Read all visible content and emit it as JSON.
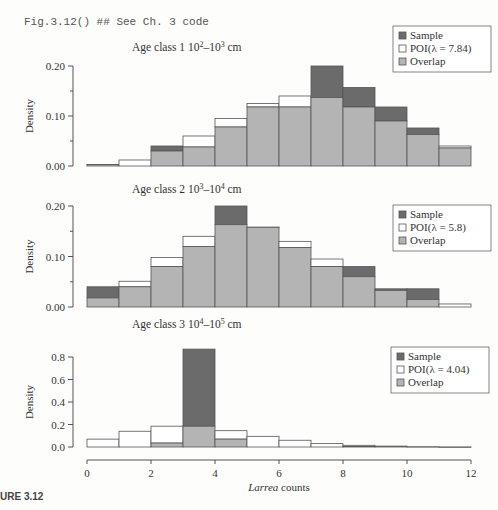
{
  "header": {
    "code_line": "Fig.3.12() ## See Ch. 3 code"
  },
  "caption": "URE 3.12",
  "colors": {
    "sample": "#6b6b6b",
    "poi": "#ffffff",
    "overlap": "#b4b4b4",
    "edge": "#555555"
  },
  "chart_data": [
    {
      "type": "bar",
      "title": "Age class 1  10²–10³ cm",
      "title_parts": {
        "prefix": "Age class 1  10",
        "sup1": "2",
        "mid": "–10",
        "sup2": "3",
        "suffix": " cm"
      },
      "ylabel": "Density",
      "ylim": [
        0,
        0.2
      ],
      "yticks": [
        "0.00",
        "0.10",
        "0.20"
      ],
      "bins": [
        0,
        1,
        2,
        3,
        4,
        5,
        6,
        7,
        8,
        9,
        10,
        11
      ],
      "series": [
        {
          "name": "Sample",
          "values": [
            0.003,
            0.0,
            0.04,
            0.038,
            0.078,
            0.118,
            0.118,
            0.2,
            0.157,
            0.118,
            0.076,
            0.036
          ]
        },
        {
          "name": "POI(λ = 7.84)",
          "values": [
            0.003,
            0.012,
            0.03,
            0.06,
            0.095,
            0.125,
            0.14,
            0.137,
            0.118,
            0.09,
            0.063,
            0.04
          ]
        }
      ],
      "legend": [
        "Sample",
        "POI(λ = 7.84)",
        "Overlap"
      ],
      "legend_position": "top-right"
    },
    {
      "type": "bar",
      "title": "Age class 2  10³–10⁴ cm",
      "title_parts": {
        "prefix": "Age class 2  10",
        "sup1": "3",
        "mid": "–10",
        "sup2": "4",
        "suffix": " cm"
      },
      "ylabel": "Density",
      "ylim": [
        0,
        0.2
      ],
      "yticks": [
        "0.00",
        "0.10",
        "0.20"
      ],
      "bins": [
        0,
        1,
        2,
        3,
        4,
        5,
        6,
        7,
        8,
        9,
        10,
        11
      ],
      "series": [
        {
          "name": "Sample",
          "values": [
            0.04,
            0.04,
            0.08,
            0.12,
            0.2,
            0.158,
            0.118,
            0.08,
            0.08,
            0.036,
            0.036,
            0.0
          ]
        },
        {
          "name": "POI(λ = 5.8)",
          "values": [
            0.018,
            0.051,
            0.098,
            0.14,
            0.163,
            0.158,
            0.13,
            0.095,
            0.06,
            0.033,
            0.015,
            0.006
          ]
        }
      ],
      "legend": [
        "Sample",
        "POI(λ = 5.8)",
        "Overlap"
      ],
      "legend_position": "right"
    },
    {
      "type": "bar",
      "title": "Age class 3  10⁴–10⁵ cm",
      "title_parts": {
        "prefix": "Age class 3  10",
        "sup1": "4",
        "mid": "–10",
        "sup2": "5",
        "suffix": " cm"
      },
      "ylabel": "Density",
      "ylim": [
        0,
        0.9
      ],
      "yticks": [
        "0.0",
        "0.2",
        "0.4",
        "0.6",
        "0.8"
      ],
      "bins": [
        0,
        1,
        2,
        3,
        4,
        5,
        6,
        7,
        8,
        9,
        10,
        11
      ],
      "series": [
        {
          "name": "Sample",
          "values": [
            0.0,
            0.0,
            0.035,
            0.87,
            0.07,
            0.0,
            0.0,
            0.0,
            0.005,
            0.0,
            0.0,
            0.0
          ]
        },
        {
          "name": "POI(λ = 4.04)",
          "values": [
            0.07,
            0.14,
            0.185,
            0.185,
            0.145,
            0.095,
            0.06,
            0.03,
            0.015,
            0.008,
            0.003,
            0.001
          ]
        }
      ],
      "legend": [
        "Sample",
        "POI(λ = 4.04)",
        "Overlap"
      ],
      "legend_position": "right",
      "xlabel_italic": "Larrea",
      "xlabel_rest": " counts",
      "xticks": [
        "0",
        "2",
        "4",
        "6",
        "8",
        "10",
        "12"
      ],
      "xlim": [
        0,
        12
      ]
    }
  ]
}
